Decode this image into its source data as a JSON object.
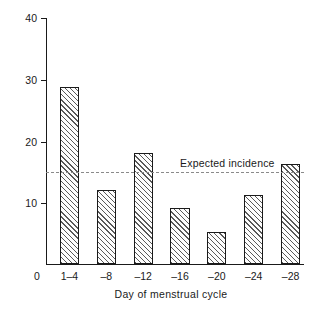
{
  "chart_data": {
    "type": "bar",
    "title": "",
    "xlabel": "Day of menstrual cycle",
    "ylabel": "% of offences",
    "categories": [
      "1–4",
      "–8",
      "–12",
      "–16",
      "–20",
      "–24",
      "–28"
    ],
    "values": [
      28.7,
      12.0,
      18.0,
      9.0,
      5.2,
      11.2,
      16.2
    ],
    "ylim": [
      0,
      40
    ],
    "yticks": [
      0,
      10,
      20,
      30,
      40
    ],
    "ytick_labels": [
      "0",
      "10",
      "20",
      "30",
      "40"
    ],
    "origin_label": "0",
    "grid": false,
    "legend": false,
    "annotations": [
      {
        "name": "expected-incidence",
        "label": "Expected incidence",
        "type": "hline",
        "value": 15,
        "style": "dashed"
      }
    ],
    "bar_style": {
      "fill": "hatched-diagonal",
      "edge_color": "#1a1a1a",
      "face_color": "#fdfdfd"
    }
  }
}
